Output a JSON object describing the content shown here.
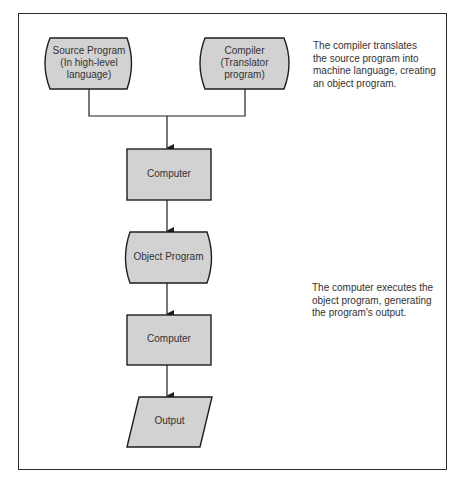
{
  "diagram": {
    "type": "flowchart",
    "colors": {
      "fill": "#d2d2d2",
      "stroke": "#1e1e1e",
      "frame": "#2d2d2d",
      "background": "#ffffff"
    },
    "nodes": [
      {
        "id": "source",
        "shape": "stored-data",
        "lines": [
          "Source Program",
          "(In high-level",
          "language)"
        ]
      },
      {
        "id": "compiler",
        "shape": "stored-data",
        "lines": [
          "Compiler",
          "(Translator",
          "program)"
        ]
      },
      {
        "id": "computer1",
        "shape": "process",
        "lines": [
          "Computer"
        ]
      },
      {
        "id": "object",
        "shape": "stored-data",
        "lines": [
          "Object Program"
        ]
      },
      {
        "id": "computer2",
        "shape": "process",
        "lines": [
          "Computer"
        ]
      },
      {
        "id": "output",
        "shape": "input-output",
        "lines": [
          "Output"
        ]
      }
    ],
    "edges": [
      {
        "from": "source",
        "to": "computer1"
      },
      {
        "from": "compiler",
        "to": "computer1"
      },
      {
        "from": "computer1",
        "to": "object"
      },
      {
        "from": "object",
        "to": "computer2"
      },
      {
        "from": "computer2",
        "to": "output"
      }
    ],
    "notes": [
      {
        "id": "note1",
        "lines": [
          "The compiler translates",
          "the source program into",
          "machine language, creating",
          "an object program."
        ]
      },
      {
        "id": "note2",
        "lines": [
          "The computer executes the",
          "object program, generating",
          "the program's output."
        ]
      }
    ]
  }
}
